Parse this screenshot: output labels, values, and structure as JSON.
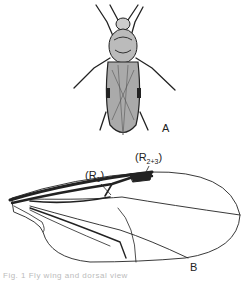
{
  "figure": {
    "panel_a": {
      "label": "A",
      "subject": "fly-dorsal-view"
    },
    "panel_b": {
      "label": "B",
      "subject": "fly-wing",
      "vein_labels": [
        {
          "text_main": "(R",
          "sub": "1",
          "close": ")"
        },
        {
          "text_main": "(R",
          "sub": "2+3",
          "close": ")"
        }
      ]
    },
    "caption": "Fig. 1 Fly wing and dorsal view"
  },
  "colors": {
    "ink": "#1a1a1a",
    "background": "#ffffff"
  }
}
